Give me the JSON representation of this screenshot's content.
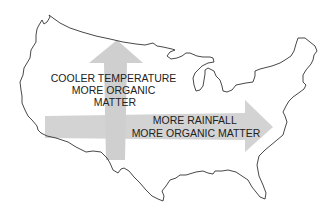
{
  "diagram": {
    "type": "map-diagram",
    "map": "contiguous-united-states-outline",
    "colors": {
      "background": "#ffffff",
      "outline": "#333333",
      "arrow_fill": "#d3d3d3",
      "text": "#222222"
    },
    "arrows": [
      {
        "direction": "north",
        "label_lines": [
          "COOLER TEMPERATURE",
          "MORE ORGANIC",
          "MATTER"
        ]
      },
      {
        "direction": "east",
        "label_lines": [
          "MORE RAINFALL",
          "MORE ORGANIC MATTER"
        ]
      }
    ]
  }
}
